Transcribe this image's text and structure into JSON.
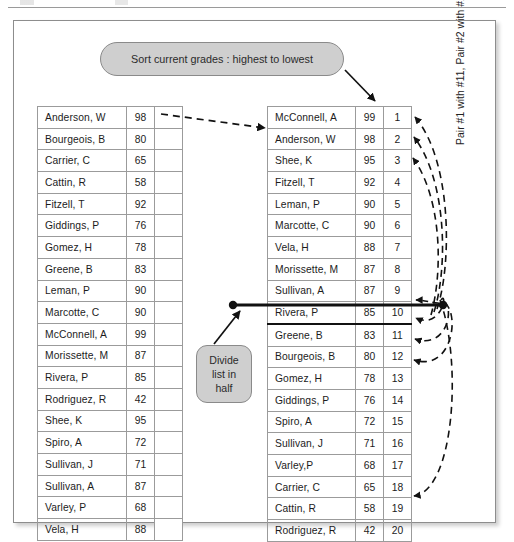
{
  "figure": {
    "callouts": {
      "sort_label": "Sort current grades : highest to lowest",
      "divide_line1": "Divide",
      "divide_line2": "list in",
      "divide_line3": "half"
    },
    "pair_note": "Pair #1 with #11, Pair #2 with #12, Pair #10 with #20, Etc.",
    "colors": {
      "callout_fill": "#cfcfcf",
      "callout_border": "#8a8a8a",
      "table_border": "#9b9b9b",
      "divider": "#111111",
      "frame_border": "#8d8d8d",
      "text": "#1c1c1c"
    },
    "unsorted_table": {
      "columns": [
        "name",
        "score",
        ""
      ],
      "rows": [
        [
          "Anderson, W",
          "98",
          ""
        ],
        [
          "Bourgeois, B",
          "80",
          ""
        ],
        [
          "Carrier, C",
          "65",
          ""
        ],
        [
          "Cattin, R",
          "58",
          ""
        ],
        [
          "Fitzell, T",
          "92",
          ""
        ],
        [
          "Giddings, P",
          "76",
          ""
        ],
        [
          "Gomez, H",
          "78",
          ""
        ],
        [
          "Greene, B",
          "83",
          ""
        ],
        [
          "Leman, P",
          "90",
          ""
        ],
        [
          "Marcotte, C",
          "90",
          ""
        ],
        [
          "McConnell, A",
          "99",
          ""
        ],
        [
          "Morissette, M",
          "87",
          ""
        ],
        [
          "Rivera, P",
          "85",
          ""
        ],
        [
          "Rodriguez, R",
          "42",
          ""
        ],
        [
          "Shee, K",
          "95",
          ""
        ],
        [
          "Spiro, A",
          "72",
          ""
        ],
        [
          "Sullivan, J",
          "71",
          ""
        ],
        [
          "Sullivan, A",
          "87",
          ""
        ],
        [
          "Varley, P",
          "68",
          ""
        ],
        [
          "Vela, H",
          "88",
          ""
        ]
      ]
    },
    "sorted_table": {
      "columns": [
        "name",
        "score",
        "rank"
      ],
      "split_after_row": 10,
      "rows": [
        [
          "McConnell, A",
          "99",
          "1"
        ],
        [
          "Anderson, W",
          "98",
          "2"
        ],
        [
          "Shee, K",
          "95",
          "3"
        ],
        [
          "Fitzell, T",
          "92",
          "4"
        ],
        [
          "Leman, P",
          "90",
          "5"
        ],
        [
          "Marcotte, C",
          "90",
          "6"
        ],
        [
          "Vela, H",
          "88",
          "7"
        ],
        [
          "Morissette, M",
          "87",
          "8"
        ],
        [
          "Sullivan, A",
          "87",
          "9"
        ],
        [
          "Rivera, P",
          "85",
          "10"
        ],
        [
          "Greene, B",
          "83",
          "11"
        ],
        [
          "Bourgeois, B",
          "80",
          "12"
        ],
        [
          "Gomez, H",
          "78",
          "13"
        ],
        [
          "Giddings, P",
          "76",
          "14"
        ],
        [
          "Spiro, A",
          "72",
          "15"
        ],
        [
          "Sullivan, J",
          "71",
          "16"
        ],
        [
          "Varley,P",
          "68",
          "17"
        ],
        [
          "Carrier, C",
          "65",
          "18"
        ],
        [
          "Cattin, R",
          "58",
          "19"
        ],
        [
          "Rodriguez, R",
          "42",
          "20"
        ]
      ]
    }
  }
}
